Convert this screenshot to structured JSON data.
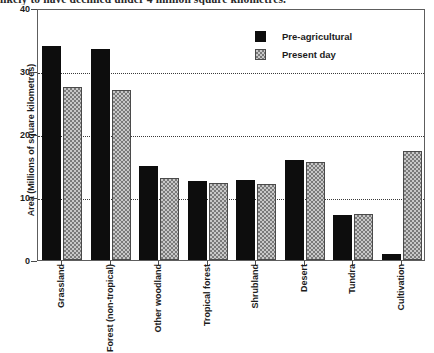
{
  "caption": "likely to have declined under 4 million square kilometres.",
  "legend": {
    "position": "top-right",
    "entries": [
      {
        "label": "Pre-agricultural",
        "color": "#0d0d0d",
        "pattern": "solid"
      },
      {
        "label": "Present day",
        "color": "#c8c8c8",
        "pattern": "checkered"
      }
    ]
  },
  "axis": {
    "y_title": "Area (Millions of square kilometres)",
    "y_ticks": [
      "0",
      "10",
      "20",
      "30",
      "40"
    ]
  },
  "chart_data": {
    "type": "bar",
    "title": "",
    "subtitle": "",
    "xlabel": "",
    "ylabel": "Area (Millions of square kilometres)",
    "ylim": [
      0,
      40
    ],
    "yticks": [
      0,
      10,
      20,
      30,
      40
    ],
    "grid": true,
    "grid_axis": "y",
    "legend_position": "top-right",
    "categories": [
      "Grassland",
      "Forest (non-tropical)",
      "Other woodland",
      "Tropical forest",
      "Shrubland",
      "Desert",
      "Tundra",
      "Cultivation"
    ],
    "series": [
      {
        "name": "Pre-agricultural",
        "color": "#0d0d0d",
        "values": [
          34,
          33.5,
          15,
          12.5,
          12.7,
          15.8,
          7.1,
          1
        ]
      },
      {
        "name": "Present day",
        "color": "#c8c8c8",
        "values": [
          27.5,
          27,
          13,
          12.3,
          12.1,
          15.5,
          7.3,
          17.3
        ]
      }
    ]
  }
}
